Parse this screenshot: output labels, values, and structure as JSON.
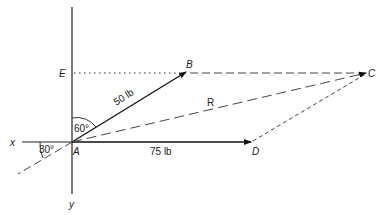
{
  "diagram": {
    "points": {
      "A": {
        "label": "A",
        "x": 72,
        "y": 142
      },
      "B": {
        "label": "B",
        "x": 186,
        "y": 72
      },
      "C": {
        "label": "C",
        "x": 367,
        "y": 73
      },
      "D": {
        "label": "D",
        "x": 251,
        "y": 142
      },
      "E": {
        "label": "E",
        "x": 72,
        "y": 73
      }
    },
    "axes": {
      "x_label": "x",
      "y_label": "y"
    },
    "vectors": [
      {
        "from": "A",
        "to": "B",
        "label": "50 lb",
        "style": "solid-arrow"
      },
      {
        "from": "A",
        "to": "D",
        "label": "75 lb",
        "style": "solid-arrow"
      },
      {
        "from": "A",
        "to": "C",
        "label": "R",
        "style": "dashed-arrow"
      }
    ],
    "construction_lines": [
      {
        "from": "E",
        "to": "B",
        "style": "dotted"
      },
      {
        "from": "B",
        "to": "C",
        "style": "dashed"
      },
      {
        "from": "D",
        "to": "C",
        "style": "dashed"
      }
    ],
    "angles": [
      {
        "label": "60°",
        "between": "y-axis and AB"
      },
      {
        "label": "30°",
        "between": "x-axis and extension of R"
      }
    ],
    "labels": {
      "A": "A",
      "B": "B",
      "C": "C",
      "D": "D",
      "E": "E",
      "x": "x",
      "y": "y",
      "ab": "50 lb",
      "ad": "75 lb",
      "r": "R",
      "angle60": "60°",
      "angle30": "30°"
    }
  }
}
